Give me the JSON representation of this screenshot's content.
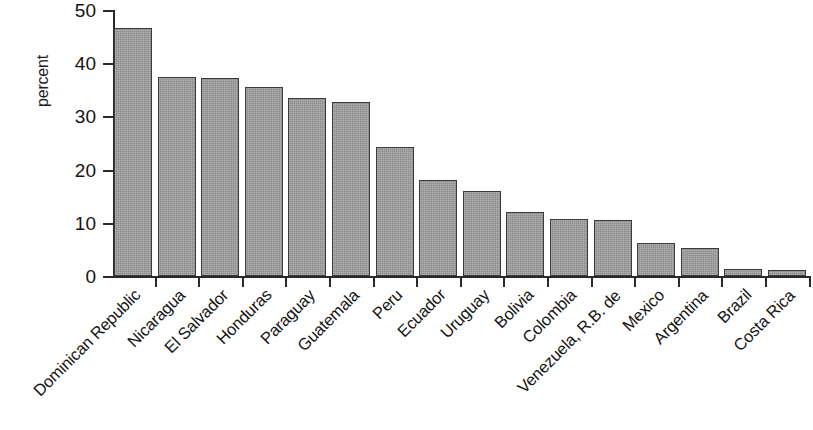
{
  "chart_data": {
    "type": "bar",
    "title": "",
    "xlabel": "",
    "ylabel": "percent",
    "ylim": [
      0,
      50
    ],
    "ytick_labels": [
      "50",
      "40",
      "30",
      "20",
      "10",
      "0"
    ],
    "yticks": [
      50,
      40,
      30,
      20,
      10,
      0
    ],
    "grid": false,
    "legend": null,
    "categories": [
      "Dominican Republic",
      "Nicaragua",
      "El Salvador",
      "Honduras",
      "Paraguay",
      "Guatemala",
      "Peru",
      "Ecuador",
      "Uruguay",
      "Bolivia",
      "Colombia",
      "Venezuela, R.B. de",
      "Mexico",
      "Argentina",
      "Brazil",
      "Costa Rica"
    ],
    "values": [
      46.6,
      37.5,
      37.2,
      35.6,
      33.5,
      32.8,
      24.3,
      18.0,
      16.0,
      12.0,
      10.8,
      10.5,
      6.2,
      5.2,
      1.3,
      1.1
    ],
    "bar_fill_color": "#9b9b9b",
    "bar_border_color": "#3a3a3a",
    "axis_color": "#2a2a2a",
    "background_color": "#ffffff"
  }
}
